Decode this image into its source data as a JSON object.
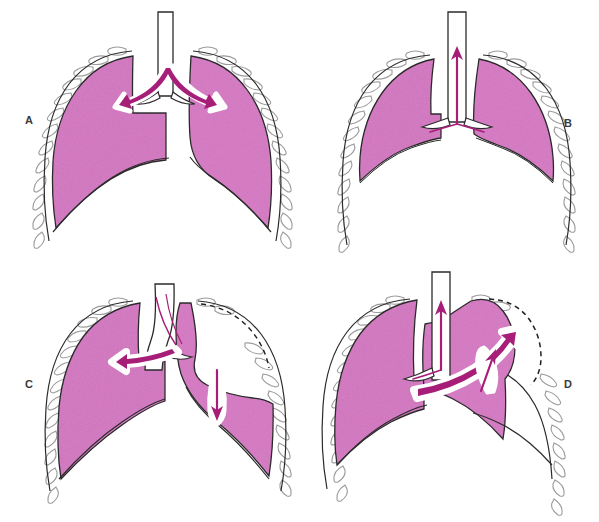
{
  "figure": {
    "background_color": "#ffffff",
    "grid": {
      "rows": 2,
      "columns": 2
    },
    "colors": {
      "lung_fill": "#d87ec6",
      "lung_fill_light": "#e295cf",
      "lung_fill_mottled": "#cf74bd",
      "arrow_stroke": "#a61e78",
      "arrow_highlight": "#ffffff",
      "outline": "#2b2b2b",
      "rib_outline": "#9b9b9b",
      "label_color": "#3a3a3a",
      "dashed_border": "#1f1f1f"
    }
  },
  "panels": [
    {
      "id": "a",
      "label": "A",
      "label_position": "left",
      "description": "Normal chest: both lungs fully expanded against the chest wall; bifurcating arrow at the carina shows air dividing into both main bronchi.",
      "arrows": [
        {
          "name": "carina-bifurcating-arrow",
          "direction": "bidirectional-lateral",
          "style": "white-outlined-magenta"
        }
      ],
      "dashed_outline": false
    },
    {
      "id": "b",
      "label": "B",
      "label_position": "right",
      "description": "Both lungs partially collapsed and retracted from the chest wall; single arrow directed upward through the trachea.",
      "arrows": [
        {
          "name": "trachea-upward-arrow",
          "direction": "up",
          "style": "thin-magenta"
        }
      ],
      "dashed_outline": false
    },
    {
      "id": "c",
      "label": "C",
      "label_position": "left",
      "description": "Mediastinal shift toward the left: arrow at the carina points left, a downward arrow lies within the right lung, and a dashed line marks the displaced border.",
      "arrows": [
        {
          "name": "mediastinal-shift-left-arrow",
          "direction": "left",
          "style": "white-outlined-magenta"
        },
        {
          "name": "right-lung-downward-arrow",
          "direction": "down",
          "style": "leaf-outlined-magenta"
        }
      ],
      "dashed_outline": true
    },
    {
      "id": "d",
      "label": "D",
      "label_position": "right",
      "description": "Tension pneumothorax: upward tracheal arrow, a long curved arrow sweeping up and to the right, a short up-right arrow inside the right hemithorax, and a dashed hyperexpanded border.",
      "arrows": [
        {
          "name": "trachea-upward-arrow",
          "direction": "up",
          "style": "thin-magenta"
        },
        {
          "name": "mediastinal-shift-right-arrow",
          "direction": "up-right",
          "style": "white-outlined-magenta"
        },
        {
          "name": "right-hemithorax-expansion-arrow",
          "direction": "up-right",
          "style": "leaf-outlined-magenta"
        }
      ],
      "dashed_outline": true
    }
  ],
  "caption": {
    "partial_text": ""
  }
}
